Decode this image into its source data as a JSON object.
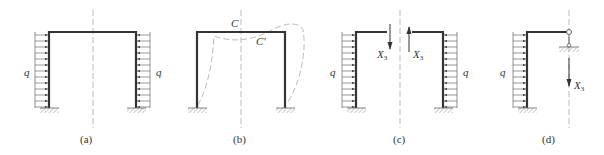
{
  "figure": {
    "panels": [
      {
        "id": "a",
        "caption": "(a)",
        "load_label_left": "q",
        "load_label_right": "q"
      },
      {
        "id": "b",
        "caption": "(b)",
        "point_label": "C",
        "point_label_deformed": "C'"
      },
      {
        "id": "c",
        "caption": "(c)",
        "load_label_left": "q",
        "load_label_right": "q",
        "force_label_left": "X",
        "force_label_right": "X",
        "force_subscript": "3"
      },
      {
        "id": "d",
        "caption": "(d)",
        "load_label": "q",
        "force_label": "X",
        "force_subscript": "3"
      }
    ],
    "colors": {
      "member": "#333333",
      "load": "#555555",
      "dashed": "#aaaaaa",
      "hatch": "#999999"
    }
  }
}
